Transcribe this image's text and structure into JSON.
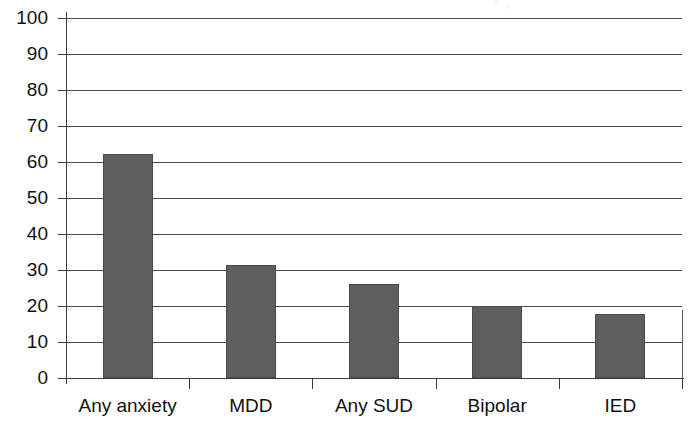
{
  "chart_data": {
    "type": "bar",
    "title": "",
    "subtitle": "",
    "xlabel": "",
    "ylabel": "",
    "categories": [
      "Any anxiety",
      "MDD",
      "Any SUD",
      "Bipolar",
      "IED"
    ],
    "values": [
      62.3,
      31.4,
      26.1,
      20.0,
      17.8
    ],
    "series": [
      {
        "name": "",
        "values": [
          62.3,
          31.4,
          26.1,
          20.0,
          17.8
        ]
      }
    ],
    "ylim": [
      0,
      100
    ],
    "y_ticks": [
      0,
      10,
      20,
      30,
      40,
      50,
      60,
      70,
      80,
      90,
      100
    ],
    "y_tick_labels": [
      "0",
      "10",
      "20",
      "30",
      "40",
      "50",
      "60",
      "70",
      "80",
      "90",
      "100"
    ],
    "grid": "horizontal",
    "legend": "none",
    "bar_color": "#5e5e5e",
    "bar_edge_color": "#4a4a4a",
    "grid_color": "#4a4a4a",
    "axis_color": "#3d3d3d",
    "background_color": "#ffffff",
    "annotations": []
  },
  "artifact": {
    "top_fragment": "' ,"
  }
}
